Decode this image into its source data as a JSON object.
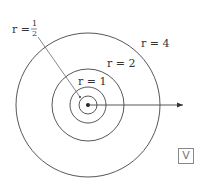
{
  "diagram": {
    "center": {
      "x": 88,
      "y": 105
    },
    "scale_px_per_unit": 18,
    "circles": [
      {
        "r_label": "r = 4",
        "r": 4
      },
      {
        "r_label": "r = 2",
        "r": 2
      },
      {
        "r_label": "r = 1",
        "r": 1
      },
      {
        "r_label": "r = 1/2",
        "r": 0.5
      }
    ],
    "labels": {
      "r_half_var": "r =",
      "r_half_num": "1",
      "r_half_den": "2",
      "r_one": "r = 1",
      "r_two": "r = 2",
      "r_four": "r = 4"
    },
    "colors": {
      "stroke": "#333333"
    }
  },
  "badge": {
    "text": "V"
  }
}
